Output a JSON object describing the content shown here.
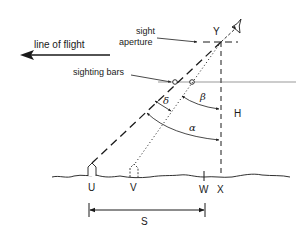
{
  "diagram": {
    "labels": {
      "line_of_flight": "line of flight",
      "sight_aperture_1": "sight",
      "sight_aperture_2": "aperture",
      "sighting_bars": "sighting bars",
      "Y": "Y",
      "H": "H",
      "alpha": "α",
      "beta": "β",
      "delta": "δ",
      "U": "U",
      "V": "V",
      "W": "W",
      "X": "X",
      "S": "S"
    },
    "colors": {
      "stroke": "#1a1a1a",
      "background": "#ffffff"
    }
  }
}
